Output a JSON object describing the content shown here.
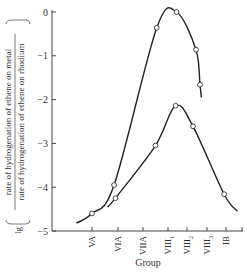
{
  "chart_data": {
    "type": "line",
    "title": "",
    "xlabel": "Group",
    "ylabel": "lg (rate of hydrogenation of ethene on metal / rate of hydrogenation of ethene on rhodium)",
    "ylabel_prefix": "lg",
    "ylabel_numerator": "rate of hydrogenation of ethene on metal",
    "ylabel_denominator": "rate of hydrogenation of ethene on rhodium",
    "categories": [
      "VA",
      "VIA",
      "VIIA",
      "VIII1",
      "VIII2",
      "VIII3",
      "IB"
    ],
    "category_labels": [
      {
        "main": "VA",
        "sub": ""
      },
      {
        "main": "VIA",
        "sub": ""
      },
      {
        "main": "VIIA",
        "sub": ""
      },
      {
        "main": "VIII",
        "sub": "1"
      },
      {
        "main": "VIII",
        "sub": "2"
      },
      {
        "main": "VIII",
        "sub": "3"
      },
      {
        "main": "IB",
        "sub": ""
      }
    ],
    "yticks": [
      0,
      -1,
      -2,
      -3,
      -4,
      -5
    ],
    "ytick_labels": [
      "0",
      "−1",
      "−2",
      "−3",
      "−4",
      "−5"
    ],
    "ylim": [
      -5,
      0
    ],
    "grid": false,
    "legend": false,
    "series": [
      {
        "name": "upper curve",
        "points": [
          {
            "x": 0.0,
            "y": -4.6
          },
          {
            "x": 0.85,
            "y": -3.95
          },
          {
            "x": 2.55,
            "y": -0.36
          },
          {
            "x": 3.45,
            "y": 0.0
          },
          {
            "x": 4.45,
            "y": -0.86
          },
          {
            "x": 4.65,
            "y": -1.66
          }
        ]
      },
      {
        "name": "lower curve",
        "points": [
          {
            "x": 0.9,
            "y": -4.25
          },
          {
            "x": 2.5,
            "y": -3.05
          },
          {
            "x": 3.4,
            "y": -2.14
          },
          {
            "x": 4.3,
            "y": -2.61
          },
          {
            "x": 5.9,
            "y": -4.16
          }
        ]
      }
    ]
  }
}
